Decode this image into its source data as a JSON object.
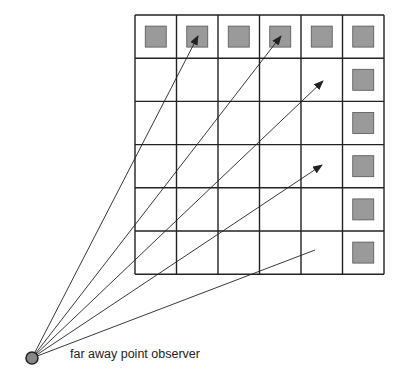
{
  "diagram": {
    "grid": {
      "rows": 6,
      "cols": 6,
      "left": 135,
      "top": 15,
      "cell_w": 41.5,
      "cell_h": 43.2
    },
    "square_color": "#9a9a9a",
    "line_color": "#222222",
    "observer": {
      "x": 32,
      "y": 358,
      "label": "far away point observer",
      "color": "#888888"
    },
    "squares": [
      [
        0,
        0
      ],
      [
        1,
        0
      ],
      [
        2,
        0
      ],
      [
        3,
        0
      ],
      [
        4,
        0
      ],
      [
        5,
        0
      ],
      [
        5,
        1
      ],
      [
        5,
        2
      ],
      [
        5,
        3
      ],
      [
        5,
        4
      ],
      [
        5,
        5
      ]
    ],
    "rays": [
      {
        "to": [
          198,
          36
        ],
        "arrow": true
      },
      {
        "to": [
          281,
          36
        ],
        "arrow": true
      },
      {
        "to": [
          323,
          81
        ],
        "arrow": true
      },
      {
        "to": [
          322,
          165
        ],
        "arrow": true
      },
      {
        "to": [
          315,
          250
        ],
        "arrow": false
      }
    ]
  }
}
